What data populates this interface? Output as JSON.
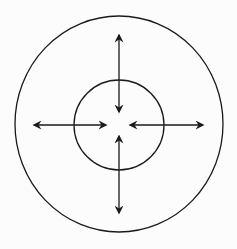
{
  "diagram": {
    "type": "concentric-circles-with-bidirectional-arrows",
    "width": 237,
    "height": 249,
    "background": "#fcfcfc",
    "stroke": "#1a1a1a",
    "outer_circle": {
      "cx": 119,
      "cy": 124,
      "rx": 104,
      "ry": 108
    },
    "inner_circle": {
      "cx": 119,
      "cy": 125,
      "r": 45
    },
    "arrows": [
      {
        "name": "arrow-top",
        "x1": 119,
        "y1": 35,
        "x2": 119,
        "y2": 112
      },
      {
        "name": "arrow-bottom",
        "x1": 119,
        "y1": 136,
        "x2": 119,
        "y2": 213
      },
      {
        "name": "arrow-left",
        "x1": 34,
        "y1": 125,
        "x2": 106,
        "y2": 125
      },
      {
        "name": "arrow-right",
        "x1": 130,
        "y1": 125,
        "x2": 203,
        "y2": 125
      }
    ],
    "labels": []
  }
}
